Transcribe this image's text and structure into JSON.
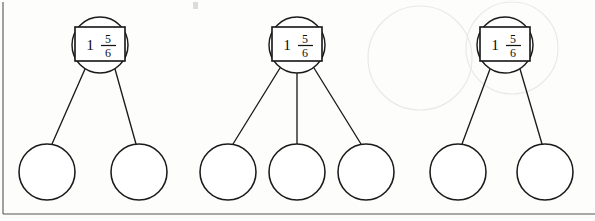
{
  "page": {
    "background_color": "#fdfdfc",
    "ink_color": "#1b1b1b",
    "border_color": "#555555",
    "width": 595,
    "height": 221
  },
  "bonds": [
    {
      "name": "number-bond-1",
      "whole": "1",
      "numerator": "5",
      "denominator": "6",
      "value_label": "1 5/6",
      "parent": {
        "cx": 100,
        "cy": 45,
        "r": 28
      },
      "box": {
        "x": 75,
        "y": 27,
        "width": 50,
        "height": 34
      },
      "children": [
        {
          "cx": 47,
          "cy": 172,
          "r": 28,
          "value": ""
        },
        {
          "cx": 139,
          "cy": 172,
          "r": 28,
          "value": ""
        }
      ]
    },
    {
      "name": "number-bond-2",
      "whole": "1",
      "numerator": "5",
      "denominator": "6",
      "value_label": "1 5/6",
      "parent": {
        "cx": 297,
        "cy": 45,
        "r": 28
      },
      "box": {
        "x": 272,
        "y": 27,
        "width": 50,
        "height": 34
      },
      "children": [
        {
          "cx": 228,
          "cy": 172,
          "r": 28,
          "value": ""
        },
        {
          "cx": 297,
          "cy": 172,
          "r": 28,
          "value": ""
        },
        {
          "cx": 366,
          "cy": 172,
          "r": 28,
          "value": ""
        }
      ]
    },
    {
      "name": "number-bond-3",
      "whole": "1",
      "numerator": "5",
      "denominator": "6",
      "value_label": "1 5/6",
      "parent": {
        "cx": 505,
        "cy": 45,
        "r": 28
      },
      "box": {
        "x": 480,
        "y": 27,
        "width": 50,
        "height": 34
      },
      "children": [
        {
          "cx": 458,
          "cy": 172,
          "r": 28,
          "value": ""
        },
        {
          "cx": 545,
          "cy": 172,
          "r": 28,
          "value": ""
        }
      ]
    }
  ],
  "border": {
    "left_x": 3,
    "bottom_y": 214,
    "top_y": 2
  }
}
